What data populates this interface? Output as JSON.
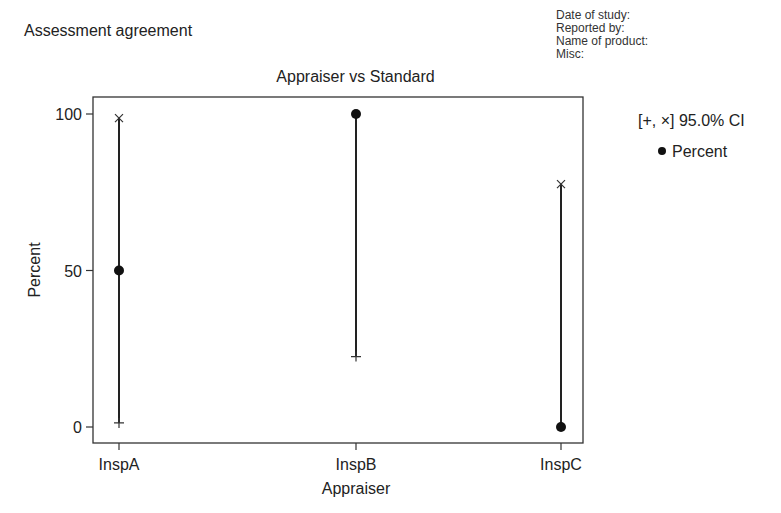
{
  "header": {
    "title": "Assessment agreement",
    "meta": [
      "Date of study:",
      "Reported by:",
      "Name of product:",
      "Misc:"
    ]
  },
  "legend": {
    "ci_label": "[+, ×] 95.0% CI",
    "percent_label": "Percent"
  },
  "chart_data": {
    "type": "scatter",
    "title": "Appraiser vs Standard",
    "xlabel": "Appraiser",
    "ylabel": "Percent",
    "categories": [
      "InspA",
      "InspB",
      "InspC"
    ],
    "series": [
      {
        "name": "Percent",
        "marker": "filled-circle",
        "values": [
          50,
          100,
          0
        ]
      },
      {
        "name": "95.0% CI lower",
        "marker": "+",
        "values": [
          1.3,
          22.5,
          0
        ]
      },
      {
        "name": "95.0% CI upper",
        "marker": "x",
        "values": [
          98.7,
          100,
          77.6
        ]
      }
    ],
    "ylim": [
      0,
      100
    ],
    "yticks": [
      0,
      50,
      100
    ],
    "grid": false,
    "legend_position": "right"
  }
}
